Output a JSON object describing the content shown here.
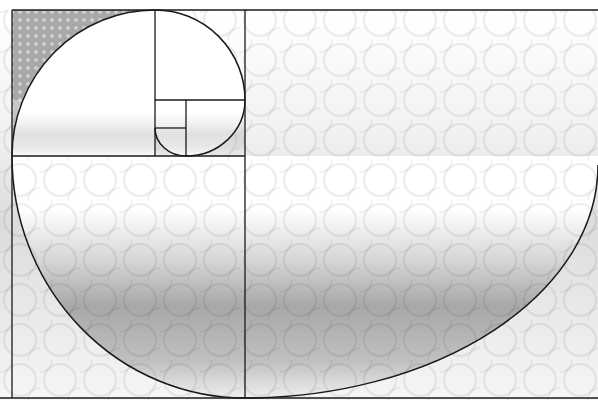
{
  "diagram": {
    "type": "golden-spiral",
    "caption_partial": "— — — — — —",
    "colors": {
      "line": "#1a1a1a",
      "background": "#ffffff",
      "texture_dark": "#8c8c8c",
      "texture_light": "#e6e6e6"
    },
    "frame": {
      "left": 12,
      "top": 10,
      "right": 598,
      "bottom": 398
    },
    "squares": [
      {
        "x": 12,
        "y": 10,
        "w": 143,
        "h": 146
      },
      {
        "x": 155,
        "y": 10,
        "w": 90,
        "h": 90
      },
      {
        "x": 186,
        "y": 100,
        "w": 59,
        "h": 56
      },
      {
        "x": 155,
        "y": 128,
        "w": 31,
        "h": 28
      },
      {
        "x": 155,
        "y": 100,
        "w": 31,
        "h": 28
      },
      {
        "x": 12,
        "y": 156,
        "w": 233,
        "h": 242
      },
      {
        "x": 245,
        "y": 10,
        "w": 353,
        "h": 388
      }
    ]
  }
}
